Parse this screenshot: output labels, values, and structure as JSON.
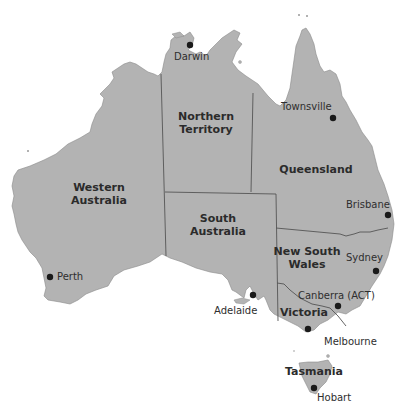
{
  "map": {
    "title": "Australia states and capital cities",
    "colors": {
      "land": "#b3b3b3",
      "border": "#555555",
      "ocean": "#ffffff",
      "dot": "#1a1a1a",
      "text": "#2b2b2b"
    },
    "states": [
      {
        "name": "Western Australia",
        "line1": "Western",
        "line2": "Australia"
      },
      {
        "name": "Northern Territory",
        "line1": "Northern",
        "line2": "Territory"
      },
      {
        "name": "South Australia",
        "line1": "South",
        "line2": "Australia"
      },
      {
        "name": "Queensland",
        "line1": "Queensland"
      },
      {
        "name": "New South Wales",
        "line1": "New South",
        "line2": "Wales"
      },
      {
        "name": "Victoria",
        "line1": "Victoria"
      },
      {
        "name": "Tasmania",
        "line1": "Tasmania"
      }
    ],
    "cities": [
      {
        "name": "Darwin"
      },
      {
        "name": "Townsville"
      },
      {
        "name": "Brisbane"
      },
      {
        "name": "Sydney"
      },
      {
        "name": "Canberra (ACT)"
      },
      {
        "name": "Melbourne"
      },
      {
        "name": "Adelaide"
      },
      {
        "name": "Perth"
      },
      {
        "name": "Hobart"
      }
    ]
  }
}
